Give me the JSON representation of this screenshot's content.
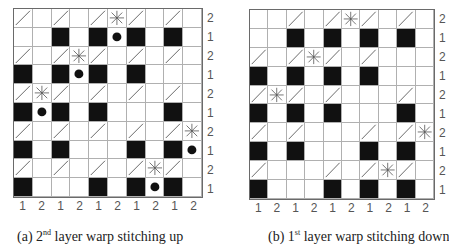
{
  "legend": {
    "black": "black-square",
    "diag": "diagonal-line",
    "star": "asterisk-star",
    "dot": "black-dot"
  },
  "panels": [
    {
      "id": "a",
      "caption_prefix": "(a) 2",
      "caption_sup": "nd",
      "caption_suffix": " layer warp stitching up",
      "row_labels": [
        "2",
        "1",
        "2",
        "1",
        "2",
        "1",
        "2",
        "1",
        "2",
        "1"
      ],
      "col_labels": [
        "1",
        "2",
        "1",
        "2",
        "1",
        "2",
        "1",
        "2",
        "1",
        "2"
      ],
      "rows": [
        {
          "diag": [
            0,
            2,
            4,
            6,
            8
          ],
          "black": [],
          "star": [
            5
          ],
          "dot": []
        },
        {
          "diag": [],
          "black": [
            2,
            4,
            6,
            8
          ],
          "star": [],
          "dot": [
            5
          ]
        },
        {
          "diag": [
            0,
            2,
            4,
            6,
            8
          ],
          "black": [],
          "star": [
            3
          ],
          "dot": []
        },
        {
          "diag": [],
          "black": [
            0,
            2,
            4,
            6
          ],
          "star": [],
          "dot": [
            3
          ]
        },
        {
          "diag": [
            0,
            2,
            4,
            6,
            8
          ],
          "black": [],
          "star": [
            1
          ],
          "dot": []
        },
        {
          "diag": [],
          "black": [
            0,
            2,
            4,
            8
          ],
          "star": [],
          "dot": [
            1
          ]
        },
        {
          "diag": [
            0,
            2,
            4,
            6,
            8
          ],
          "black": [],
          "star": [
            9
          ],
          "dot": []
        },
        {
          "diag": [],
          "black": [
            0,
            2,
            6,
            8
          ],
          "star": [],
          "dot": [
            9
          ]
        },
        {
          "diag": [
            0,
            2,
            4,
            6,
            8
          ],
          "black": [],
          "star": [
            7
          ],
          "dot": []
        },
        {
          "diag": [],
          "black": [
            0,
            4,
            6,
            8
          ],
          "star": [],
          "dot": [
            7
          ]
        }
      ]
    },
    {
      "id": "b",
      "caption_prefix": "(b) 1",
      "caption_sup": "st",
      "caption_suffix": " layer warp stitching down",
      "row_labels": [
        "2",
        "1",
        "2",
        "1",
        "2",
        "1",
        "2",
        "1",
        "2",
        "1"
      ],
      "col_labels": [
        "1",
        "2",
        "1",
        "2",
        "1",
        "2",
        "1",
        "2",
        "1",
        "2"
      ],
      "rows": [
        {
          "diag": [
            2,
            4,
            6,
            8
          ],
          "black": [],
          "star": [
            5
          ],
          "dot": []
        },
        {
          "diag": [],
          "black": [
            2,
            4,
            6,
            8
          ],
          "star": [],
          "dot": []
        },
        {
          "diag": [
            0,
            2,
            4,
            6
          ],
          "black": [],
          "star": [
            3
          ],
          "dot": []
        },
        {
          "diag": [],
          "black": [
            0,
            2,
            4,
            6
          ],
          "star": [],
          "dot": []
        },
        {
          "diag": [
            0,
            2,
            4,
            8
          ],
          "black": [],
          "star": [
            1
          ],
          "dot": []
        },
        {
          "diag": [],
          "black": [
            0,
            2,
            4,
            8
          ],
          "star": [],
          "dot": []
        },
        {
          "diag": [
            0,
            2,
            6,
            8
          ],
          "black": [],
          "star": [
            9
          ],
          "dot": []
        },
        {
          "diag": [],
          "black": [
            0,
            2,
            6,
            8
          ],
          "star": [],
          "dot": []
        },
        {
          "diag": [
            0,
            4,
            6,
            8
          ],
          "black": [],
          "star": [
            7
          ],
          "dot": []
        },
        {
          "diag": [],
          "black": [
            0,
            4,
            6,
            8
          ],
          "star": [],
          "dot": []
        }
      ]
    }
  ],
  "colors": {
    "black_cell": "#111111",
    "grid_line": "#b0b0b0",
    "diag_line": "#444444",
    "star_line": "#555555"
  }
}
